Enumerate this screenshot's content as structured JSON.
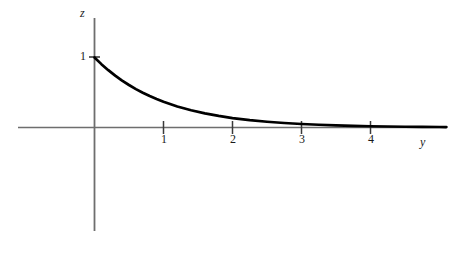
{
  "figure": {
    "background_color": "#ffffff",
    "axis_color": "#6e6e6e",
    "curve_color": "#000000",
    "text_color": "#1a1a1a"
  },
  "labels": {
    "vertical_axis": "z",
    "horizontal_axis": "y",
    "y_value_one": "1"
  },
  "chart_data": {
    "type": "line",
    "title": "",
    "subtitle": "",
    "xlabel": "y",
    "ylabel": "z",
    "function": "z = e^(-y)",
    "grid": false,
    "legend": null,
    "xlim": [
      -1.1,
      5.1
    ],
    "ylim": [
      -1.5,
      1.55
    ],
    "xticks": [
      1,
      2,
      3,
      4
    ],
    "xtick_labels": [
      "1",
      "2",
      "3",
      "4"
    ],
    "yticks": [
      1
    ],
    "ytick_labels": [
      "1"
    ],
    "annotations": [],
    "series": [
      {
        "name": "z = e^(-y)",
        "color": "#000000",
        "x": [
          0,
          0.1,
          0.2,
          0.3,
          0.4,
          0.5,
          0.6,
          0.7,
          0.8,
          0.9,
          1,
          1.2,
          1.4,
          1.6,
          1.8,
          2,
          2.25,
          2.5,
          2.75,
          3,
          3.25,
          3.5,
          3.75,
          4,
          4.25,
          4.5,
          4.75,
          5,
          5.1
        ],
        "y": [
          1,
          0.905,
          0.819,
          0.741,
          0.67,
          0.607,
          0.549,
          0.497,
          0.449,
          0.407,
          0.368,
          0.301,
          0.247,
          0.202,
          0.165,
          0.135,
          0.105,
          0.082,
          0.064,
          0.05,
          0.039,
          0.03,
          0.024,
          0.018,
          0.014,
          0.011,
          0.009,
          0.007,
          0.006
        ]
      }
    ]
  }
}
